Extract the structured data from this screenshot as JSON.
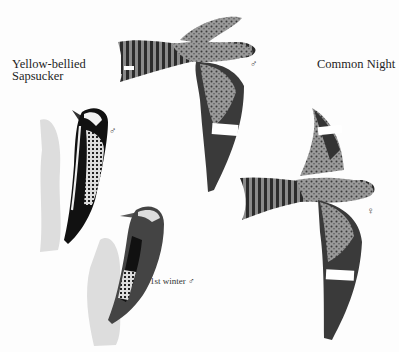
{
  "plate": {
    "species": [
      {
        "name_line1": "Yellow-bellied",
        "name_line2": "Sapsucker",
        "figures": [
          {
            "caption": "♂"
          },
          {
            "caption": "1st winter ♂"
          }
        ]
      },
      {
        "name": "Common Night",
        "figures": [
          {
            "caption": "♂"
          },
          {
            "caption": "♀"
          }
        ]
      }
    ]
  }
}
